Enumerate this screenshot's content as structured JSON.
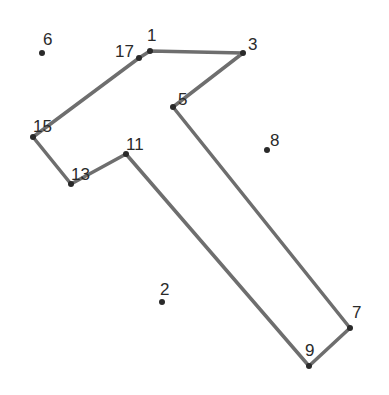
{
  "puzzle": {
    "type": "connect-the-dots",
    "line_color": "#6e6e6e",
    "dot_color": "#2a2a2a",
    "path_order": [
      "1",
      "3",
      "5",
      "7",
      "9",
      "11",
      "13",
      "15",
      "17"
    ],
    "points": [
      {
        "label": "1",
        "x": 150,
        "y": 51,
        "lx": 147,
        "ly": 41
      },
      {
        "label": "2",
        "x": 162,
        "y": 302,
        "lx": 160,
        "ly": 295
      },
      {
        "label": "3",
        "x": 243,
        "y": 53,
        "lx": 248,
        "ly": 50
      },
      {
        "label": "5",
        "x": 173,
        "y": 107,
        "lx": 178,
        "ly": 105
      },
      {
        "label": "6",
        "x": 42,
        "y": 53,
        "lx": 43,
        "ly": 45
      },
      {
        "label": "7",
        "x": 350,
        "y": 328,
        "lx": 352,
        "ly": 318
      },
      {
        "label": "8",
        "x": 267,
        "y": 150,
        "lx": 270,
        "ly": 146
      },
      {
        "label": "9",
        "x": 309,
        "y": 366,
        "lx": 305,
        "ly": 356
      },
      {
        "label": "11",
        "x": 126,
        "y": 154,
        "lx": 126,
        "ly": 150
      },
      {
        "label": "13",
        "x": 71,
        "y": 184,
        "lx": 71,
        "ly": 180
      },
      {
        "label": "15",
        "x": 33,
        "y": 137,
        "lx": 33,
        "ly": 132
      },
      {
        "label": "17",
        "x": 139,
        "y": 58,
        "lx": 115,
        "ly": 57
      }
    ]
  }
}
